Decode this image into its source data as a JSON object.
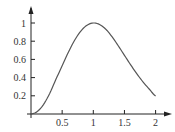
{
  "chart_data": {
    "type": "line",
    "title": "",
    "xlabel": "",
    "ylabel": "",
    "xlim": [
      0,
      2.2
    ],
    "ylim": [
      0,
      1.1
    ],
    "grid": false,
    "legend": null,
    "x_ticks": [
      0.5,
      1,
      1.5,
      2
    ],
    "x_tick_labels": [
      "0.5",
      "1",
      "1.5",
      "2"
    ],
    "y_ticks": [
      0.2,
      0.4,
      0.6,
      0.8,
      1
    ],
    "y_tick_labels": [
      "0.2",
      "0.4",
      "0.6",
      "0.8",
      "1"
    ],
    "series": [
      {
        "name": "f(x)",
        "x": [
          0,
          0.1,
          0.2,
          0.3,
          0.4,
          0.5,
          0.6,
          0.7,
          0.8,
          0.9,
          1.0,
          1.1,
          1.2,
          1.3,
          1.4,
          1.5,
          1.6,
          1.7,
          1.8,
          1.9,
          2.0
        ],
        "values": [
          0,
          0.027,
          0.104,
          0.226,
          0.381,
          0.529,
          0.679,
          0.81,
          0.912,
          0.976,
          1.0,
          0.984,
          0.932,
          0.85,
          0.75,
          0.645,
          0.54,
          0.441,
          0.351,
          0.272,
          0.199
        ]
      }
    ],
    "colors": {
      "axis": "#222222",
      "curve": "#555555",
      "text": "#333333"
    }
  }
}
